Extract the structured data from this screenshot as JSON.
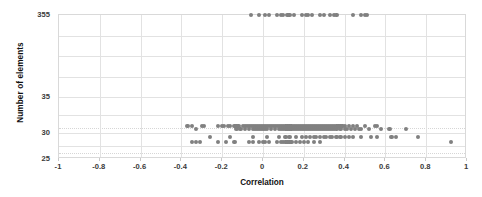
{
  "chart_data": {
    "type": "scatter",
    "title": "",
    "xlabel": "Correlation",
    "ylabel": "Number of elements",
    "xlim": [
      -1,
      1
    ],
    "xticks": [
      -1,
      -0.8,
      -0.6,
      -0.4,
      -0.2,
      0,
      0.2,
      0.4,
      0.6,
      0.8,
      1
    ],
    "xticklabels": [
      "-1",
      "-0.8",
      "-0.6",
      "-0.4",
      "-0.2",
      "0",
      "0.2",
      "0.4",
      "0.6",
      "0.8",
      "1"
    ],
    "yticks": [
      25,
      30,
      35,
      355
    ],
    "yticklabels": [
      "25",
      "30",
      "35",
      "355"
    ],
    "y_axis_note": "broken/non-linear axis: labelled ticks 25, 30, 35, 355",
    "grid": true,
    "legend": false,
    "marker_color": "#808080",
    "marker_size": 4,
    "series": [
      {
        "name": "elements",
        "points": [
          [
            -0.06,
            355
          ],
          [
            -0.02,
            355
          ],
          [
            0.01,
            355
          ],
          [
            0.03,
            355
          ],
          [
            0.07,
            355
          ],
          [
            0.09,
            355
          ],
          [
            0.1,
            355
          ],
          [
            0.12,
            355
          ],
          [
            0.13,
            355
          ],
          [
            0.15,
            355
          ],
          [
            0.19,
            355
          ],
          [
            0.21,
            355
          ],
          [
            0.22,
            355
          ],
          [
            0.24,
            355
          ],
          [
            0.28,
            355
          ],
          [
            0.3,
            355
          ],
          [
            0.33,
            355
          ],
          [
            0.35,
            355
          ],
          [
            0.36,
            355
          ],
          [
            0.44,
            355
          ],
          [
            0.48,
            355
          ],
          [
            0.5,
            355
          ],
          [
            0.51,
            355
          ],
          [
            -0.37,
            31
          ],
          [
            -0.35,
            31
          ],
          [
            -0.3,
            31
          ],
          [
            -0.29,
            31
          ],
          [
            -0.22,
            31
          ],
          [
            -0.2,
            31
          ],
          [
            -0.19,
            31
          ],
          [
            -0.17,
            31
          ],
          [
            -0.16,
            31
          ],
          [
            -0.14,
            31
          ],
          [
            -0.13,
            31
          ],
          [
            -0.12,
            31
          ],
          [
            -0.1,
            31
          ],
          [
            -0.09,
            31
          ],
          [
            -0.08,
            31
          ],
          [
            -0.07,
            31
          ],
          [
            -0.06,
            31
          ],
          [
            -0.05,
            31
          ],
          [
            -0.04,
            31
          ],
          [
            -0.03,
            31
          ],
          [
            -0.02,
            31
          ],
          [
            -0.01,
            31
          ],
          [
            0.0,
            31
          ],
          [
            0.01,
            31
          ],
          [
            0.02,
            31
          ],
          [
            0.03,
            31
          ],
          [
            0.04,
            31
          ],
          [
            0.05,
            31
          ],
          [
            0.06,
            31
          ],
          [
            0.07,
            31
          ],
          [
            0.08,
            31
          ],
          [
            0.09,
            31
          ],
          [
            0.1,
            31
          ],
          [
            0.11,
            31
          ],
          [
            0.12,
            31
          ],
          [
            0.13,
            31
          ],
          [
            0.14,
            31
          ],
          [
            0.15,
            31
          ],
          [
            0.16,
            31
          ],
          [
            0.17,
            31
          ],
          [
            0.18,
            31
          ],
          [
            0.19,
            31
          ],
          [
            0.2,
            31
          ],
          [
            0.21,
            31
          ],
          [
            0.22,
            31
          ],
          [
            0.23,
            31
          ],
          [
            0.24,
            31
          ],
          [
            0.25,
            31
          ],
          [
            0.26,
            31
          ],
          [
            0.27,
            31
          ],
          [
            0.28,
            31
          ],
          [
            0.29,
            31
          ],
          [
            0.3,
            31
          ],
          [
            0.31,
            31
          ],
          [
            0.32,
            31
          ],
          [
            0.33,
            31
          ],
          [
            0.34,
            31
          ],
          [
            0.35,
            31
          ],
          [
            0.36,
            31
          ],
          [
            0.37,
            31
          ],
          [
            0.38,
            31
          ],
          [
            0.39,
            31
          ],
          [
            0.4,
            31
          ],
          [
            0.42,
            31
          ],
          [
            0.44,
            31
          ],
          [
            0.46,
            31
          ],
          [
            0.5,
            31
          ],
          [
            0.55,
            31
          ],
          [
            0.56,
            31
          ],
          [
            -0.33,
            30.6
          ],
          [
            -0.13,
            30.6
          ],
          [
            -0.11,
            30.6
          ],
          [
            -0.09,
            30.6
          ],
          [
            -0.07,
            30.6
          ],
          [
            -0.05,
            30.6
          ],
          [
            -0.04,
            30.6
          ],
          [
            -0.03,
            30.6
          ],
          [
            -0.02,
            30.6
          ],
          [
            -0.01,
            30.6
          ],
          [
            0.0,
            30.6
          ],
          [
            0.01,
            30.6
          ],
          [
            0.02,
            30.6
          ],
          [
            0.04,
            30.6
          ],
          [
            0.06,
            30.6
          ],
          [
            0.08,
            30.6
          ],
          [
            0.09,
            30.6
          ],
          [
            0.1,
            30.6
          ],
          [
            0.11,
            30.6
          ],
          [
            0.12,
            30.6
          ],
          [
            0.13,
            30.6
          ],
          [
            0.14,
            30.6
          ],
          [
            0.15,
            30.6
          ],
          [
            0.16,
            30.6
          ],
          [
            0.17,
            30.6
          ],
          [
            0.18,
            30.6
          ],
          [
            0.19,
            30.6
          ],
          [
            0.2,
            30.6
          ],
          [
            0.21,
            30.6
          ],
          [
            0.22,
            30.6
          ],
          [
            0.23,
            30.6
          ],
          [
            0.24,
            30.6
          ],
          [
            0.25,
            30.6
          ],
          [
            0.26,
            30.6
          ],
          [
            0.27,
            30.6
          ],
          [
            0.28,
            30.6
          ],
          [
            0.29,
            30.6
          ],
          [
            0.3,
            30.6
          ],
          [
            0.31,
            30.6
          ],
          [
            0.32,
            30.6
          ],
          [
            0.33,
            30.6
          ],
          [
            0.34,
            30.6
          ],
          [
            0.35,
            30.6
          ],
          [
            0.36,
            30.6
          ],
          [
            0.38,
            30.6
          ],
          [
            0.4,
            30.6
          ],
          [
            0.41,
            30.6
          ],
          [
            0.43,
            30.6
          ],
          [
            0.45,
            30.6
          ],
          [
            0.47,
            30.6
          ],
          [
            0.48,
            30.6
          ],
          [
            0.52,
            30.6
          ],
          [
            0.58,
            30.6
          ],
          [
            0.62,
            30.6
          ],
          [
            0.7,
            30.6
          ],
          [
            -0.26,
            29.3
          ],
          [
            -0.16,
            29.3
          ],
          [
            -0.05,
            29.3
          ],
          [
            0.02,
            29.3
          ],
          [
            0.08,
            29.3
          ],
          [
            0.11,
            29.3
          ],
          [
            0.13,
            29.3
          ],
          [
            0.16,
            29.3
          ],
          [
            0.19,
            29.3
          ],
          [
            0.21,
            29.3
          ],
          [
            0.23,
            29.3
          ],
          [
            0.25,
            29.3
          ],
          [
            0.26,
            29.3
          ],
          [
            0.28,
            29.3
          ],
          [
            0.3,
            29.3
          ],
          [
            0.31,
            29.3
          ],
          [
            0.33,
            29.3
          ],
          [
            0.34,
            29.3
          ],
          [
            0.36,
            29.3
          ],
          [
            0.38,
            29.3
          ],
          [
            0.4,
            29.3
          ],
          [
            0.42,
            29.3
          ],
          [
            0.44,
            29.3
          ],
          [
            0.48,
            29.3
          ],
          [
            0.53,
            29.3
          ],
          [
            0.56,
            29.3
          ],
          [
            0.63,
            29.3
          ],
          [
            0.65,
            29.3
          ],
          [
            0.76,
            29.3
          ],
          [
            -0.35,
            28.3
          ],
          [
            -0.33,
            28.3
          ],
          [
            -0.31,
            28.3
          ],
          [
            -0.22,
            28.3
          ],
          [
            -0.18,
            28.3
          ],
          [
            -0.14,
            28.3
          ],
          [
            -0.07,
            28.3
          ],
          [
            -0.05,
            28.3
          ],
          [
            -0.02,
            28.3
          ],
          [
            0.0,
            28.3
          ],
          [
            0.01,
            28.3
          ],
          [
            0.03,
            28.3
          ],
          [
            0.07,
            28.3
          ],
          [
            0.09,
            28.3
          ],
          [
            0.1,
            28.3
          ],
          [
            0.11,
            28.3
          ],
          [
            0.12,
            28.3
          ],
          [
            0.13,
            28.3
          ],
          [
            0.14,
            28.3
          ],
          [
            0.16,
            28.3
          ],
          [
            0.18,
            28.3
          ],
          [
            0.2,
            28.3
          ],
          [
            0.22,
            28.3
          ],
          [
            0.25,
            28.3
          ],
          [
            0.28,
            28.3
          ],
          [
            0.92,
            28.3
          ]
        ]
      }
    ]
  }
}
